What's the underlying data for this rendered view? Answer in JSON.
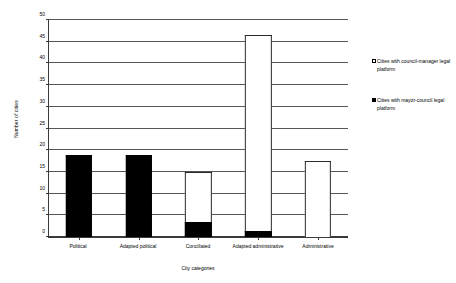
{
  "chart_data": {
    "type": "bar",
    "subtype": "stacked-bar",
    "title": "",
    "xlabel": "City categories",
    "ylabel": "Number of cities",
    "ylim": [
      0,
      50
    ],
    "ytick_step": 5,
    "yticks": [
      0,
      5,
      10,
      15,
      20,
      25,
      30,
      35,
      40,
      45,
      50
    ],
    "ytick_labels": [
      "0",
      "5",
      "10",
      "15",
      "20",
      "25",
      "30",
      "35",
      "40",
      "45",
      "50"
    ],
    "grid": "horizontal",
    "legend_position": "right",
    "categories": [
      "Political",
      "Adapted political",
      "Conciliated",
      "Adapted administrative",
      "Administrative"
    ],
    "series": [
      {
        "name": "Cities with mayor-council legal platform",
        "color": "#000000",
        "swatch": "black",
        "values": [
          19,
          19,
          3.5,
          1.5,
          0
        ]
      },
      {
        "name": "Cities with council-manager legal platform",
        "color": "#ffffff",
        "swatch": "white",
        "values": [
          0,
          0,
          11.5,
          45,
          17.5
        ]
      }
    ],
    "totals": [
      19,
      19,
      15,
      46.5,
      17.5
    ]
  },
  "legend": {
    "entries": [
      {
        "label": "Cities with council-manager legal platform",
        "swatch": "white",
        "color": "#ffffff"
      },
      {
        "label": "Cities with mayor-council legal platform",
        "swatch": "black",
        "color": "#000000"
      }
    ]
  },
  "axes": {
    "y_title": "Number of cities",
    "x_title": "City categories"
  }
}
